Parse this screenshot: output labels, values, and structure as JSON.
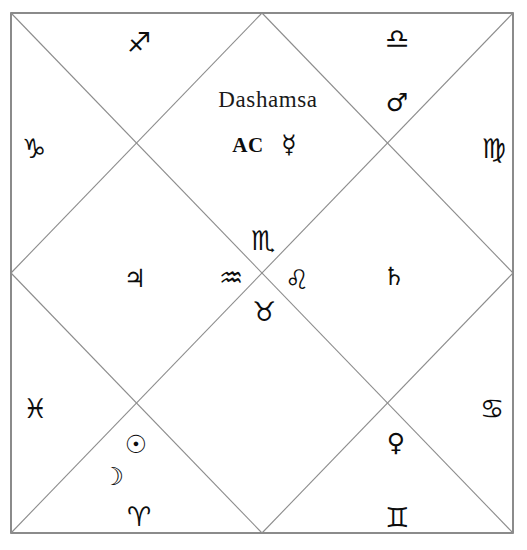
{
  "chart": {
    "title": "Dashamsa",
    "style": "north-indian-vedic",
    "ascendant_label": "AC",
    "frame": {
      "line_color": "#8c8c8c",
      "border_color": "#6e6e6e",
      "background": "#ffffff"
    }
  },
  "signs": [
    {
      "name": "sagittarius",
      "glyph": "♐",
      "house_position": "top-left-diamond"
    },
    {
      "name": "libra",
      "glyph": "♎",
      "house_position": "top-right-diamond"
    },
    {
      "name": "capricorn",
      "glyph": "♑",
      "house_position": "left-upper-triangle"
    },
    {
      "name": "virgo",
      "glyph": "♍",
      "house_position": "right-upper-triangle"
    },
    {
      "name": "scorpio",
      "glyph": "♏",
      "house_position": "center-top"
    },
    {
      "name": "aquarius",
      "glyph": "♒",
      "house_position": "center-left"
    },
    {
      "name": "leo",
      "glyph": "♌",
      "house_position": "center-right"
    },
    {
      "name": "taurus",
      "glyph": "♉",
      "house_position": "center-bottom"
    },
    {
      "name": "pisces",
      "glyph": "♓",
      "house_position": "left-lower-triangle"
    },
    {
      "name": "cancer",
      "glyph": "♋",
      "house_position": "right-lower-triangle"
    },
    {
      "name": "aries",
      "glyph": "♈",
      "house_position": "bottom-left-diamond"
    },
    {
      "name": "gemini",
      "glyph": "♊",
      "house_position": "bottom-right-diamond"
    }
  ],
  "planets": [
    {
      "name": "mercury",
      "glyph": "☿",
      "house_position": "center-top-diamond"
    },
    {
      "name": "mars",
      "glyph": "♂",
      "house_position": "top-right-diamond"
    },
    {
      "name": "jupiter",
      "glyph": "♃",
      "house_position": "left-middle-diamond"
    },
    {
      "name": "saturn",
      "glyph": "♄",
      "house_position": "right-middle-diamond"
    },
    {
      "name": "sun",
      "glyph": "☉",
      "house_position": "bottom-left-triangle"
    },
    {
      "name": "moon",
      "glyph": "☽",
      "house_position": "bottom-left-triangle"
    },
    {
      "name": "venus",
      "glyph": "♀",
      "house_position": "bottom-right-triangle"
    }
  ]
}
